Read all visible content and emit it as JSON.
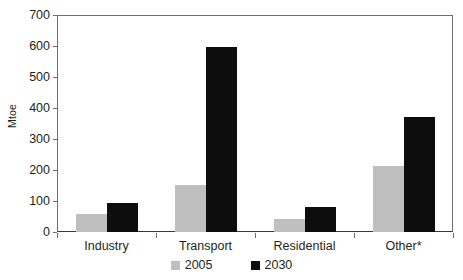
{
  "chart_data": {
    "type": "bar",
    "title": "",
    "xlabel": "",
    "ylabel": "Mtoe",
    "ylim": [
      0,
      700
    ],
    "ytick_step": 100,
    "yticks": [
      700,
      600,
      500,
      400,
      300,
      200,
      100,
      0
    ],
    "ytick_labels": [
      "700",
      "600",
      "500",
      "400",
      "300",
      "200",
      "100",
      "0"
    ],
    "grid": false,
    "legend_position": "bottom-center",
    "categories": [
      "Industry",
      "Transport",
      "Residential",
      "Other*"
    ],
    "series": [
      {
        "name": "2005",
        "color": "#bfbfbf",
        "values": [
          57,
          152,
          42,
          212
        ]
      },
      {
        "name": "2030",
        "color": "#0d0d0d",
        "values": [
          95,
          597,
          82,
          370
        ]
      }
    ]
  },
  "axis": {
    "y_title": "Mtoe"
  },
  "legend": {
    "items": [
      {
        "label": "2005",
        "color": "#bfbfbf"
      },
      {
        "label": "2030",
        "color": "#0d0d0d"
      }
    ]
  },
  "colors": {
    "series_2005": "#bfbfbf",
    "series_2030": "#0d0d0d",
    "axis": "#6d6e71",
    "text": "#231f20",
    "background": "#ffffff"
  }
}
